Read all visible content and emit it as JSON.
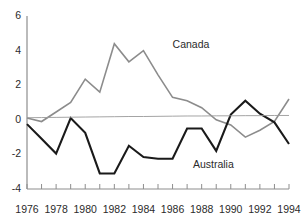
{
  "chart_data": {
    "type": "line",
    "title": "",
    "subtitle": "",
    "xlabel": "",
    "ylabel": "",
    "xlim": [
      1976,
      1994
    ],
    "ylim": [
      -4,
      6
    ],
    "yticks": [
      6,
      4,
      2,
      0,
      -2,
      -4
    ],
    "ytick_labels": [
      "6",
      "4",
      "2",
      "0",
      "-2",
      "-4"
    ],
    "xticks": [
      1976,
      1977,
      1978,
      1979,
      1980,
      1981,
      1982,
      1983,
      1984,
      1985,
      1986,
      1987,
      1988,
      1989,
      1990,
      1991,
      1992,
      1993,
      1994
    ],
    "xtick_labels_shown": [
      "1976",
      "1978",
      "1980",
      "1982",
      "1984",
      "1986",
      "1988",
      "1990",
      "1992",
      "1994"
    ],
    "grid": false,
    "legend_position": "inline-annotation",
    "x": [
      1976,
      1977,
      1978,
      1979,
      1980,
      1981,
      1982,
      1983,
      1984,
      1985,
      1986,
      1987,
      1988,
      1989,
      1990,
      1991,
      1992,
      1993,
      1994
    ],
    "series": [
      {
        "name": "Canada",
        "color": "#8c8c8c",
        "width": 1.6,
        "label_x": 1986.0,
        "label_y": 4.4,
        "values": [
          0.1,
          -0.1,
          0.45,
          1.0,
          2.35,
          1.6,
          4.4,
          3.35,
          4.0,
          2.6,
          1.3,
          1.1,
          0.7,
          0.0,
          -0.3,
          -1.0,
          -0.6,
          -0.1,
          1.2
        ]
      },
      {
        "name": "Australia",
        "color": "#1a1a1a",
        "width": 2.1,
        "label_x": 1987.4,
        "label_y": -2.55,
        "values": [
          -0.25,
          -1.1,
          -1.95,
          0.1,
          -0.75,
          -3.1,
          -3.1,
          -1.5,
          -2.15,
          -2.25,
          -2.25,
          -0.5,
          -0.5,
          -1.8,
          0.3,
          1.1,
          0.35,
          -0.15,
          -1.4
        ]
      },
      {
        "name": "zero-reference",
        "color": "#9a9a9a",
        "width": 0.9,
        "values": [
          0.12,
          0.13,
          0.14,
          0.15,
          0.16,
          0.17,
          0.18,
          0.19,
          0.19,
          0.2,
          0.21,
          0.22,
          0.22,
          0.23,
          0.23,
          0.24,
          0.24,
          0.25,
          0.25
        ]
      }
    ],
    "annotations": [
      {
        "text": "Canada",
        "x": 1986.0,
        "y": 4.4
      },
      {
        "text": "Australia",
        "x": 1987.4,
        "y": -2.55
      }
    ]
  },
  "axes": {
    "y_axis_color": "#8e8e8e",
    "x_axis_color": "#8e8e8e",
    "tick_color": "#8e8e8e"
  }
}
